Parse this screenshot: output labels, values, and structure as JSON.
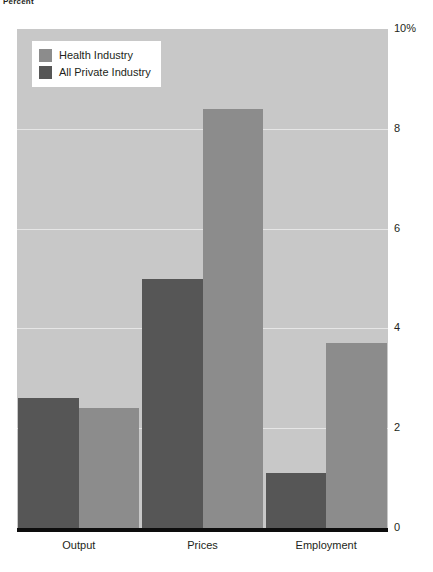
{
  "axis_caption": "Percent",
  "legend": {
    "entries": [
      {
        "label": "Health Industry",
        "color": "#8c8c8c"
      },
      {
        "label": "All Private Industry",
        "color": "#565656"
      }
    ]
  },
  "chart_data": {
    "type": "bar",
    "title": "",
    "subtitle": "",
    "xlabel": "",
    "ylabel": "Percent",
    "ylim": [
      0,
      10
    ],
    "yticks": [
      0,
      2,
      4,
      6,
      8,
      10
    ],
    "ytick_labels": [
      "0",
      "2",
      "4",
      "6",
      "8",
      "10%"
    ],
    "grid": true,
    "legend_position": "top-left",
    "categories": [
      "Output",
      "Prices",
      "Employment"
    ],
    "series": [
      {
        "name": "Health Industry",
        "color": "#565656",
        "values": [
          2.6,
          5.0,
          1.1
        ]
      },
      {
        "name": "All Private Industry",
        "color": "#8c8c8c",
        "values": [
          2.4,
          8.4,
          3.7
        ]
      }
    ]
  },
  "colors": {
    "plot_background": "#c8c8c8",
    "gridline": "#e6e6e6",
    "baseline": "#0d0d0d",
    "text": "#231f20"
  }
}
